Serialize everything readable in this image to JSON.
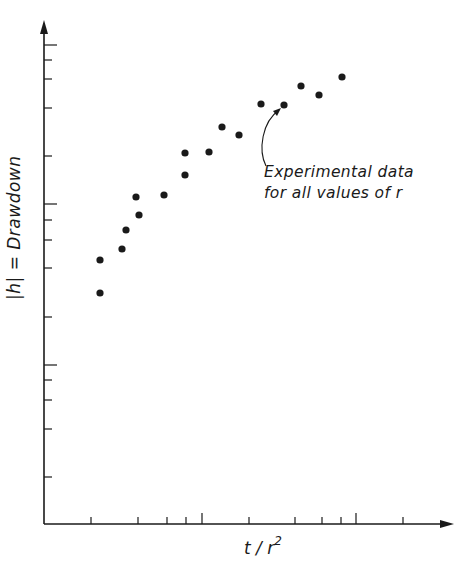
{
  "chart_data": {
    "type": "scatter",
    "title": "",
    "xlabel": "t / r^2",
    "xlabel_base": "t / r",
    "xlabel_exp": "2",
    "ylabel": "|h| = Drawdown",
    "axis_scale": "log-log (unlabeled, logarithmic tick spacing)",
    "grid": false,
    "legend": null,
    "annotation": {
      "lines": [
        "Experimental data",
        "for all values of r"
      ],
      "arrow_target_index": 14
    },
    "xlim_px": [
      44,
      440
    ],
    "ylim_px": [
      524,
      20
    ],
    "pixel_points": [
      {
        "x": 100,
        "y": 293
      },
      {
        "x": 100,
        "y": 260
      },
      {
        "x": 122,
        "y": 249
      },
      {
        "x": 126,
        "y": 230
      },
      {
        "x": 136,
        "y": 197
      },
      {
        "x": 139,
        "y": 215
      },
      {
        "x": 164,
        "y": 195
      },
      {
        "x": 185,
        "y": 175
      },
      {
        "x": 185,
        "y": 153
      },
      {
        "x": 209,
        "y": 152
      },
      {
        "x": 222,
        "y": 127
      },
      {
        "x": 239,
        "y": 135
      },
      {
        "x": 261,
        "y": 104
      },
      {
        "x": 284,
        "y": 105
      },
      {
        "x": 301,
        "y": 86
      },
      {
        "x": 319,
        "y": 95
      },
      {
        "x": 342,
        "y": 77
      }
    ],
    "x_ticks_px": [
      91,
      138,
      167,
      186,
      202,
      249,
      295,
      322,
      341,
      356,
      403
    ],
    "x_major_ticks_px": [
      202,
      356
    ],
    "y_ticks_px": [
      45,
      60,
      79,
      108,
      156,
      204,
      220,
      240,
      268,
      317,
      365,
      380,
      400,
      429,
      477
    ],
    "y_major_ticks_px": [
      45,
      204,
      365
    ],
    "tick_labels": []
  },
  "colors": {
    "ink": "#1a1a1a",
    "background": "#ffffff"
  }
}
